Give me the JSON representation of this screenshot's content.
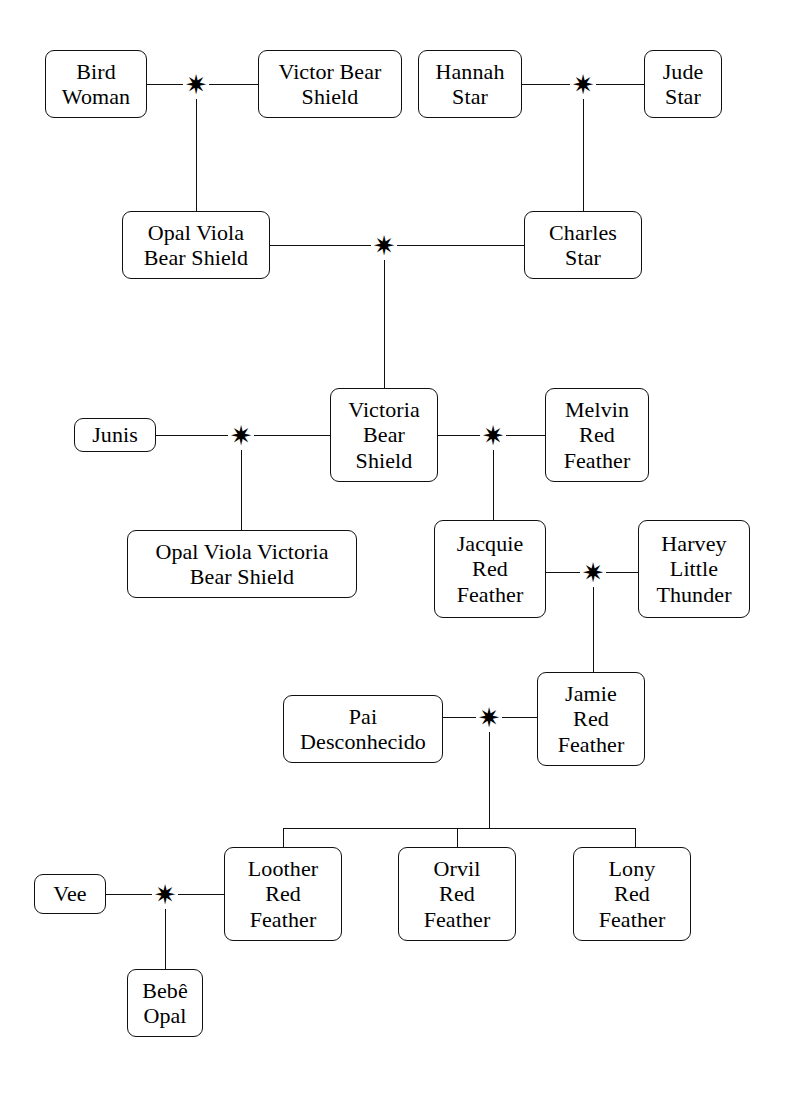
{
  "diagram": {
    "union_marker_glyph": "✷",
    "line_color": "#101010",
    "box_border_color": "#101010",
    "background_color": "#ffffff",
    "text_color": "#000000"
  },
  "people": [
    {
      "id": "bird_woman",
      "name": "Bird\nWoman",
      "x": 45,
      "y": 50,
      "w": 102,
      "h": 68
    },
    {
      "id": "victor_bear_shield",
      "name": "Victor Bear\nShield",
      "x": 258,
      "y": 50,
      "w": 144,
      "h": 68
    },
    {
      "id": "hannah_star",
      "name": "Hannah\nStar",
      "x": 418,
      "y": 50,
      "w": 104,
      "h": 68
    },
    {
      "id": "jude_star",
      "name": "Jude\nStar",
      "x": 644,
      "y": 50,
      "w": 78,
      "h": 68
    },
    {
      "id": "opal_viola_bs",
      "name": "Opal Viola\nBear Shield",
      "x": 122,
      "y": 211,
      "w": 148,
      "h": 68
    },
    {
      "id": "charles_star",
      "name": "Charles\nStar",
      "x": 524,
      "y": 211,
      "w": 118,
      "h": 68
    },
    {
      "id": "junis",
      "name": "Junis",
      "x": 74,
      "y": 418,
      "w": 82,
      "h": 34
    },
    {
      "id": "victoria_bs",
      "name": "Victoria\nBear\nShield",
      "x": 330,
      "y": 388,
      "w": 108,
      "h": 94
    },
    {
      "id": "melvin_rf",
      "name": "Melvin\nRed\nFeather",
      "x": 545,
      "y": 388,
      "w": 104,
      "h": 94
    },
    {
      "id": "opal_viola_v_bs",
      "name": "Opal Viola Victoria\nBear Shield",
      "x": 127,
      "y": 530,
      "w": 230,
      "h": 68
    },
    {
      "id": "jacquie_rf",
      "name": "Jacquie\nRed\nFeather",
      "x": 434,
      "y": 520,
      "w": 112,
      "h": 98
    },
    {
      "id": "harvey_lt",
      "name": "Harvey\nLittle\nThunder",
      "x": 638,
      "y": 520,
      "w": 112,
      "h": 98
    },
    {
      "id": "pai_desconhecido",
      "name": "Pai\nDesconhecido",
      "x": 283,
      "y": 695,
      "w": 160,
      "h": 68
    },
    {
      "id": "jamie_rf",
      "name": "Jamie\nRed\nFeather",
      "x": 537,
      "y": 672,
      "w": 108,
      "h": 94
    },
    {
      "id": "vee",
      "name": "Vee",
      "x": 34,
      "y": 874,
      "w": 72,
      "h": 40
    },
    {
      "id": "loother_rf",
      "name": "Loother\nRed\nFeather",
      "x": 224,
      "y": 847,
      "w": 118,
      "h": 94
    },
    {
      "id": "orvil_rf",
      "name": "Orvil\nRed\nFeather",
      "x": 398,
      "y": 847,
      "w": 118,
      "h": 94
    },
    {
      "id": "lony_rf",
      "name": "Lony\nRed\nFeather",
      "x": 573,
      "y": 847,
      "w": 118,
      "h": 94
    },
    {
      "id": "bebe_opal",
      "name": "Bebê\nOpal",
      "x": 127,
      "y": 969,
      "w": 76,
      "h": 68
    }
  ],
  "unions": [
    {
      "id": "u_bird_victor",
      "label": "union-bird-woman-victor-bear-shield",
      "x": 196,
      "y": 84
    },
    {
      "id": "u_hannah_jude",
      "label": "union-hannah-star-jude-star",
      "x": 583,
      "y": 84
    },
    {
      "id": "u_opal_charles",
      "label": "union-opal-viola-charles-star",
      "x": 384,
      "y": 245
    },
    {
      "id": "u_junis_victoria",
      "label": "union-junis-victoria-bear-shield",
      "x": 241,
      "y": 435
    },
    {
      "id": "u_victoria_melvin",
      "label": "union-victoria-melvin-red-feather",
      "x": 493,
      "y": 435
    },
    {
      "id": "u_jacquie_harvey",
      "label": "union-jacquie-harvey-little-thunder",
      "x": 593,
      "y": 572
    },
    {
      "id": "u_pai_jamie",
      "label": "union-pai-desconhecido-jamie",
      "x": 489,
      "y": 717
    },
    {
      "id": "u_vee_loother",
      "label": "union-vee-loother-red-feather",
      "x": 165,
      "y": 894
    }
  ],
  "connectors": {
    "horizontal": [
      {
        "id": "h_bird_to_union",
        "x": 147,
        "y": 84,
        "len": 36
      },
      {
        "id": "h_union_to_victor",
        "x": 209,
        "y": 84,
        "len": 49
      },
      {
        "id": "h_hannah_to_union",
        "x": 522,
        "y": 84,
        "len": 48
      },
      {
        "id": "h_union_to_jude",
        "x": 596,
        "y": 84,
        "len": 48
      },
      {
        "id": "h_opal_to_union",
        "x": 270,
        "y": 245,
        "len": 101
      },
      {
        "id": "h_union_to_charles",
        "x": 397,
        "y": 245,
        "len": 127
      },
      {
        "id": "h_junis_to_union",
        "x": 156,
        "y": 435,
        "len": 72
      },
      {
        "id": "h_union_to_victoria",
        "x": 254,
        "y": 435,
        "len": 76
      },
      {
        "id": "h_victoria_to_union",
        "x": 438,
        "y": 435,
        "len": 42
      },
      {
        "id": "h_union_to_melvin",
        "x": 506,
        "y": 435,
        "len": 39
      },
      {
        "id": "h_jacquie_to_union",
        "x": 546,
        "y": 572,
        "len": 34
      },
      {
        "id": "h_union_to_harvey",
        "x": 606,
        "y": 572,
        "len": 32
      },
      {
        "id": "h_pai_to_union",
        "x": 443,
        "y": 717,
        "len": 33
      },
      {
        "id": "h_union_to_jamie",
        "x": 502,
        "y": 717,
        "len": 35
      },
      {
        "id": "h_vee_to_union",
        "x": 106,
        "y": 894,
        "len": 46
      },
      {
        "id": "h_union_to_loother",
        "x": 178,
        "y": 894,
        "len": 46
      },
      {
        "id": "h_sibling_bracket",
        "x": 283,
        "y": 828,
        "len": 352
      }
    ],
    "vertical": [
      {
        "id": "v_bird_union_down",
        "x": 196,
        "y": 99,
        "len": 112
      },
      {
        "id": "v_hannah_union_down",
        "x": 583,
        "y": 99,
        "len": 112
      },
      {
        "id": "v_opal_union_down",
        "x": 384,
        "y": 260,
        "len": 128
      },
      {
        "id": "v_junis_union_down",
        "x": 241,
        "y": 450,
        "len": 80
      },
      {
        "id": "v_victoria_union_down",
        "x": 493,
        "y": 450,
        "len": 70
      },
      {
        "id": "v_jacquie_union_down",
        "x": 593,
        "y": 587,
        "len": 85
      },
      {
        "id": "v_pai_union_down",
        "x": 489,
        "y": 732,
        "len": 96
      },
      {
        "id": "v_vee_union_down",
        "x": 165,
        "y": 909,
        "len": 60
      },
      {
        "id": "v_drop_loother",
        "x": 283,
        "y": 828,
        "len": 19
      },
      {
        "id": "v_drop_orvil",
        "x": 457,
        "y": 828,
        "len": 19
      },
      {
        "id": "v_drop_lony",
        "x": 635,
        "y": 828,
        "len": 19
      }
    ]
  }
}
